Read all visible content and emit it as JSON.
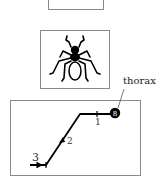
{
  "figure": {
    "panels": [
      {
        "id": "top-panel",
        "content": "cropped empty frame"
      },
      {
        "id": "insect-panel",
        "content": "insect (ant/beetle) line drawing"
      },
      {
        "id": "path-panel",
        "content": "trajectory with numbered segments"
      }
    ],
    "annotation": {
      "label": "thorax"
    },
    "path": {
      "steps": [
        {
          "label": "1"
        },
        {
          "label": "2"
        },
        {
          "label": "3"
        }
      ],
      "end_marker": "thorax-marker",
      "color": "#000000"
    },
    "border_color": "#8a8a8a"
  }
}
